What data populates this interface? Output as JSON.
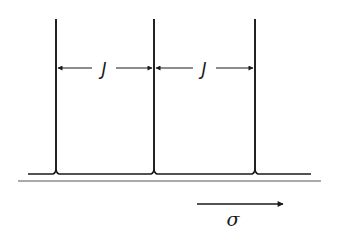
{
  "diagram": {
    "type": "spectrum-triplet-spacing",
    "peaks": [
      {
        "x": 56,
        "label": "peak-1"
      },
      {
        "x": 154,
        "label": "peak-2"
      },
      {
        "x": 255,
        "label": "peak-3"
      }
    ],
    "spacing_labels": [
      {
        "text": "J",
        "from": "peak-1",
        "to": "peak-2"
      },
      {
        "text": "J",
        "from": "peak-2",
        "to": "peak-3"
      }
    ],
    "axis_label": "σ",
    "axis_direction": "right",
    "colors": {
      "line": "#1a1a1a",
      "background": "#ffffff"
    }
  }
}
